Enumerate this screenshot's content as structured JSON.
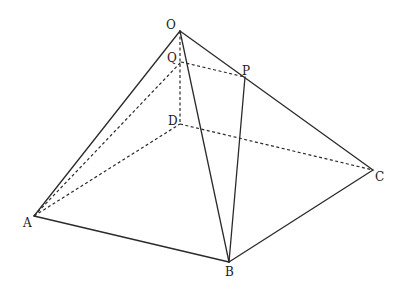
{
  "diagram": {
    "type": "pyramid",
    "labels": {
      "O": "O",
      "Q": "Q",
      "P": "P",
      "D": "D",
      "A": "A",
      "B": "B",
      "C": "C"
    },
    "points": {
      "O": [
        180,
        31
      ],
      "Q": [
        181,
        62
      ],
      "P": [
        245,
        77
      ],
      "D": [
        180,
        124
      ],
      "A": [
        34,
        216
      ],
      "B": [
        229,
        262
      ],
      "C": [
        373,
        170
      ]
    },
    "solid_edges": [
      [
        "O",
        "A"
      ],
      [
        "O",
        "B"
      ],
      [
        "O",
        "C"
      ],
      [
        "A",
        "B"
      ],
      [
        "B",
        "C"
      ],
      [
        "P",
        "B"
      ]
    ],
    "dashed_edges": [
      [
        "O",
        "D"
      ],
      [
        "A",
        "D"
      ],
      [
        "D",
        "C"
      ],
      [
        "A",
        "Q"
      ],
      [
        "Q",
        "P"
      ]
    ],
    "colors": {
      "line": "#2a2a2a",
      "background": "#ffffff"
    }
  }
}
